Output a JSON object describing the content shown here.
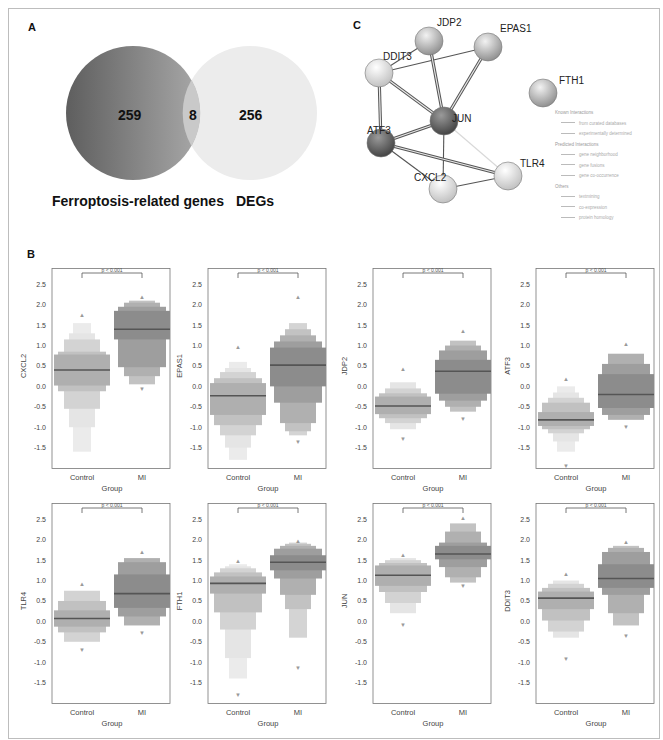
{
  "panels": {
    "a_label": "A",
    "b_label": "B",
    "c_label": "C"
  },
  "venn": {
    "left_count": "259",
    "overlap_count": "8",
    "right_count": "256",
    "left_label": "Ferroptosis-related genes",
    "right_label": "DEGs",
    "left_color": "#7a7a7a",
    "right_color": "#ececec"
  },
  "network": {
    "nodes": [
      {
        "id": "JDP2",
        "label": "JDP2",
        "x": 429,
        "y": 41,
        "shade": "mid"
      },
      {
        "id": "EPAS1",
        "label": "EPAS1",
        "x": 488,
        "y": 47,
        "shade": "mid"
      },
      {
        "id": "DDIT3",
        "label": "DDIT3",
        "x": 379,
        "y": 73,
        "shade": "light"
      },
      {
        "id": "JUN",
        "label": "JUN",
        "x": 444,
        "y": 121,
        "shade": "dark"
      },
      {
        "id": "ATF3",
        "label": "ATF3",
        "x": 381,
        "y": 143,
        "shade": "dark"
      },
      {
        "id": "TLR4",
        "label": "TLR4",
        "x": 508,
        "y": 176,
        "shade": "light"
      },
      {
        "id": "CXCL2",
        "label": "CXCL2",
        "x": 443,
        "y": 189,
        "shade": "light"
      },
      {
        "id": "FTH1",
        "label": "FTH1",
        "x": 543,
        "y": 93,
        "shade": "mid"
      }
    ],
    "edges": [
      [
        "DDIT3",
        "EPAS1",
        1
      ],
      [
        "DDIT3",
        "JDP2",
        1
      ],
      [
        "DDIT3",
        "JUN",
        3
      ],
      [
        "DDIT3",
        "ATF3",
        3
      ],
      [
        "JDP2",
        "JUN",
        3
      ],
      [
        "EPAS1",
        "JUN",
        3
      ],
      [
        "JUN",
        "ATF3",
        3
      ],
      [
        "JUN",
        "CXCL2",
        1
      ],
      [
        "JUN",
        "TLR4",
        1
      ],
      [
        "ATF3",
        "TLR4",
        3
      ],
      [
        "ATF3",
        "CXCL2",
        1
      ],
      [
        "CXCL2",
        "TLR4",
        1
      ]
    ],
    "legend": {
      "known_header": "Known Interactions",
      "known": [
        "from curated databases",
        "experimentally determined"
      ],
      "predicted_header": "Predicted Interactions",
      "predicted": [
        "gene neighborhood",
        "gene fusions",
        "gene co-occurrence"
      ],
      "others_header": "Others",
      "others": [
        "textmining",
        "co-expression",
        "protein homology"
      ]
    }
  },
  "chart_data": [
    {
      "type": "boxen",
      "gene": "CXCL2",
      "ylabel": "CXCL2",
      "xlabel": "Group",
      "categories": [
        "Control",
        "MI"
      ],
      "annotation": "p < 0.001",
      "yticks": [
        2.5,
        2.0,
        1.5,
        1.0,
        0.5,
        0.0,
        -0.5,
        -1.0,
        -1.5
      ],
      "ylim": [
        -2.0,
        2.9
      ],
      "series": [
        {
          "name": "Control",
          "median": 0.4,
          "q1": 0.02,
          "q3": 0.78,
          "outer": [
            [
              -0.12,
              0.85
            ],
            [
              -0.55,
              1.15
            ],
            [
              -1.0,
              1.3
            ],
            [
              -1.6,
              1.55
            ]
          ],
          "outliers_high": [
            1.75
          ],
          "outliers_low": []
        },
        {
          "name": "MI",
          "median": 1.4,
          "q1": 1.15,
          "q3": 1.85,
          "outer": [
            [
              0.47,
              1.95
            ],
            [
              0.25,
              2.05
            ],
            [
              0.05,
              2.1
            ]
          ],
          "outliers_high": [
            2.2
          ],
          "outliers_low": [
            -0.05
          ]
        }
      ]
    },
    {
      "type": "boxen",
      "gene": "EPAS1",
      "ylabel": "EPAS1",
      "xlabel": "Group",
      "categories": [
        "Control",
        "MI"
      ],
      "annotation": "p < 0.001",
      "yticks": [
        2.5,
        2.0,
        1.5,
        1.0,
        0.5,
        0.0,
        -0.5,
        -1.0,
        -1.5
      ],
      "ylim": [
        -2.0,
        2.9
      ],
      "series": [
        {
          "name": "Control",
          "median": -0.23,
          "q1": -0.7,
          "q3": 0.08,
          "outer": [
            [
              -0.95,
              0.2
            ],
            [
              -1.2,
              0.35
            ],
            [
              -1.5,
              0.45
            ],
            [
              -1.8,
              0.6
            ]
          ],
          "outliers_high": [
            0.97
          ],
          "outliers_low": []
        },
        {
          "name": "MI",
          "median": 0.52,
          "q1": 0.0,
          "q3": 0.95,
          "outer": [
            [
              -0.4,
              1.1
            ],
            [
              -0.9,
              1.25
            ],
            [
              -1.1,
              1.4
            ],
            [
              -1.2,
              1.55
            ]
          ],
          "outliers_high": [
            2.2
          ],
          "outliers_low": [
            -1.35
          ]
        }
      ]
    },
    {
      "type": "boxen",
      "gene": "JDP2",
      "ylabel": "JDP2",
      "xlabel": "Group",
      "categories": [
        "Control",
        "MI"
      ],
      "annotation": "p < 0.001",
      "yticks": [
        2.5,
        2.0,
        1.5,
        1.0,
        0.5,
        0.0,
        -0.5,
        -1.0,
        -1.5
      ],
      "ylim": [
        -2.0,
        2.9
      ],
      "series": [
        {
          "name": "Control",
          "median": -0.48,
          "q1": -0.68,
          "q3": -0.25,
          "outer": [
            [
              -0.78,
              -0.17
            ],
            [
              -0.9,
              -0.05
            ],
            [
              -1.05,
              0.1
            ]
          ],
          "outliers_high": [
            0.45
          ],
          "outliers_low": [
            -1.28
          ]
        },
        {
          "name": "MI",
          "median": 0.37,
          "q1": -0.18,
          "q3": 0.65,
          "outer": [
            [
              -0.35,
              0.88
            ],
            [
              -0.5,
              1.0
            ],
            [
              -0.62,
              1.12
            ]
          ],
          "outliers_high": [
            1.37
          ],
          "outliers_low": [
            -0.78
          ]
        }
      ]
    },
    {
      "type": "boxen",
      "gene": "ATF3",
      "ylabel": "ATF3",
      "xlabel": "Group",
      "categories": [
        "Control",
        "MI"
      ],
      "annotation": "p < 0.001",
      "yticks": [
        2.5,
        2.0,
        1.5,
        1.0,
        0.5,
        0.0,
        -0.5,
        -1.0,
        -1.5
      ],
      "ylim": [
        -2.0,
        2.9
      ],
      "series": [
        {
          "name": "Control",
          "median": -0.82,
          "q1": -0.97,
          "q3": -0.63,
          "outer": [
            [
              -1.05,
              -0.4
            ],
            [
              -1.15,
              -0.28
            ],
            [
              -1.35,
              -0.15
            ],
            [
              -1.6,
              0.0
            ]
          ],
          "outliers_high": [
            0.2
          ],
          "outliers_low": [
            -1.95
          ]
        },
        {
          "name": "MI",
          "median": -0.2,
          "q1": -0.53,
          "q3": 0.3,
          "outer": [
            [
              -0.7,
              0.55
            ],
            [
              -0.82,
              0.8
            ]
          ],
          "outliers_high": [
            1.05
          ],
          "outliers_low": [
            -0.98
          ]
        }
      ]
    },
    {
      "type": "boxen",
      "gene": "TLR4",
      "ylabel": "TLR4",
      "xlabel": "Group",
      "categories": [
        "Control",
        "MI"
      ],
      "annotation": "p < 0.001",
      "yticks": [
        2.5,
        2.0,
        1.5,
        1.0,
        0.5,
        0.0,
        -0.5,
        -1.0,
        -1.5
      ],
      "ylim": [
        -2.0,
        2.9
      ],
      "series": [
        {
          "name": "Control",
          "median": 0.07,
          "q1": -0.13,
          "q3": 0.27,
          "outer": [
            [
              -0.27,
              0.5
            ],
            [
              -0.5,
              0.75
            ]
          ],
          "outliers_high": [
            0.93
          ],
          "outliers_low": [
            -0.68
          ]
        },
        {
          "name": "MI",
          "median": 0.68,
          "q1": 0.33,
          "q3": 1.15,
          "outer": [
            [
              0.12,
              1.45
            ],
            [
              -0.1,
              1.55
            ]
          ],
          "outliers_high": [
            1.72
          ],
          "outliers_low": [
            -0.28
          ]
        }
      ]
    },
    {
      "type": "boxen",
      "gene": "FTH1",
      "ylabel": "FTH1",
      "xlabel": "Group",
      "categories": [
        "Control",
        "MI"
      ],
      "annotation": "p < 0.001",
      "yticks": [
        2.5,
        2.0,
        1.5,
        1.0,
        0.5,
        0.0,
        -0.5,
        -1.0,
        -1.5
      ],
      "ylim": [
        -2.0,
        2.9
      ],
      "series": [
        {
          "name": "Control",
          "median": 0.93,
          "q1": 0.68,
          "q3": 1.1,
          "outer": [
            [
              0.22,
              1.2
            ],
            [
              -0.2,
              1.3
            ],
            [
              -0.9,
              1.35
            ],
            [
              -1.4,
              1.4
            ]
          ],
          "outliers_high": [
            1.5
          ],
          "outliers_low": [
            -1.78
          ]
        },
        {
          "name": "MI",
          "median": 1.45,
          "q1": 1.25,
          "q3": 1.62,
          "outer": [
            [
              1.05,
              1.78
            ],
            [
              0.65,
              1.85
            ],
            [
              0.3,
              1.9
            ],
            [
              -0.4,
              1.93
            ]
          ],
          "outliers_high": [
            1.97
          ],
          "outliers_low": [
            -1.12
          ]
        }
      ]
    },
    {
      "type": "boxen",
      "gene": "JUN",
      "ylabel": "JUN",
      "xlabel": "Group",
      "categories": [
        "Control",
        "MI"
      ],
      "annotation": "p < 0.001",
      "yticks": [
        2.5,
        2.0,
        1.5,
        1.0,
        0.5,
        0.0,
        -0.5,
        -1.0,
        -1.5
      ],
      "ylim": [
        -2.0,
        2.9
      ],
      "series": [
        {
          "name": "Control",
          "median": 1.13,
          "q1": 0.87,
          "q3": 1.37,
          "outer": [
            [
              0.72,
              1.43
            ],
            [
              0.45,
              1.5
            ],
            [
              0.2,
              1.55
            ]
          ],
          "outliers_high": [
            1.65
          ],
          "outliers_low": [
            -0.07
          ]
        },
        {
          "name": "MI",
          "median": 1.65,
          "q1": 1.52,
          "q3": 1.85,
          "outer": [
            [
              1.33,
              1.93
            ],
            [
              1.08,
              2.2
            ],
            [
              0.95,
              2.4
            ]
          ],
          "outliers_high": [
            2.55
          ],
          "outliers_low": [
            0.88
          ]
        }
      ]
    },
    {
      "type": "boxen",
      "gene": "DDIT3",
      "ylabel": "DDIT3",
      "xlabel": "Group",
      "categories": [
        "Control",
        "MI"
      ],
      "annotation": "p < 0.001",
      "yticks": [
        2.5,
        2.0,
        1.5,
        1.0,
        0.5,
        0.0,
        -0.5,
        -1.0,
        -1.5
      ],
      "ylim": [
        -2.0,
        2.9
      ],
      "series": [
        {
          "name": "Control",
          "median": 0.57,
          "q1": 0.3,
          "q3": 0.73,
          "outer": [
            [
              0.02,
              0.82
            ],
            [
              -0.25,
              0.92
            ],
            [
              -0.4,
              1.0
            ]
          ],
          "outliers_high": [
            1.17
          ],
          "outliers_low": [
            -0.92
          ]
        },
        {
          "name": "MI",
          "median": 1.05,
          "q1": 0.82,
          "q3": 1.4,
          "outer": [
            [
              0.65,
              1.7
            ],
            [
              0.2,
              1.8
            ],
            [
              -0.1,
              1.85
            ]
          ],
          "outliers_high": [
            1.95
          ],
          "outliers_low": [
            -0.35
          ]
        }
      ]
    }
  ]
}
